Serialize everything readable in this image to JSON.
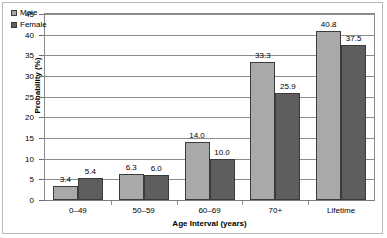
{
  "chart_data": {
    "type": "bar",
    "title": "",
    "xlabel": "Age Interval (years)",
    "ylabel": "Probability (%)",
    "categories": [
      "0–49",
      "50–59",
      "60–69",
      "70+",
      "Lifetime"
    ],
    "series": [
      {
        "name": "Male",
        "color": "#a9a9a9",
        "values": [
          3.4,
          6.3,
          14.0,
          33.3,
          40.8
        ]
      },
      {
        "name": "Female",
        "color": "#5e5e5e",
        "values": [
          5.4,
          6.0,
          10.0,
          25.9,
          37.5
        ]
      }
    ],
    "value_labels": {
      "Male": [
        "3.4",
        "6.3",
        "14.0",
        "33.3",
        "40.8"
      ],
      "Female": [
        "5.4",
        "6.0",
        "10.0",
        "25.9",
        "37.5"
      ]
    },
    "ylim": [
      0,
      45
    ],
    "yticks": [
      0,
      5,
      10,
      15,
      20,
      25,
      30,
      35,
      40,
      45
    ],
    "ytick_labels": [
      "0",
      "5",
      "10",
      "15",
      "20",
      "25",
      "30",
      "35",
      "40",
      "45"
    ],
    "grid": true,
    "grid_axis": "y",
    "legend_position": "top-left"
  }
}
